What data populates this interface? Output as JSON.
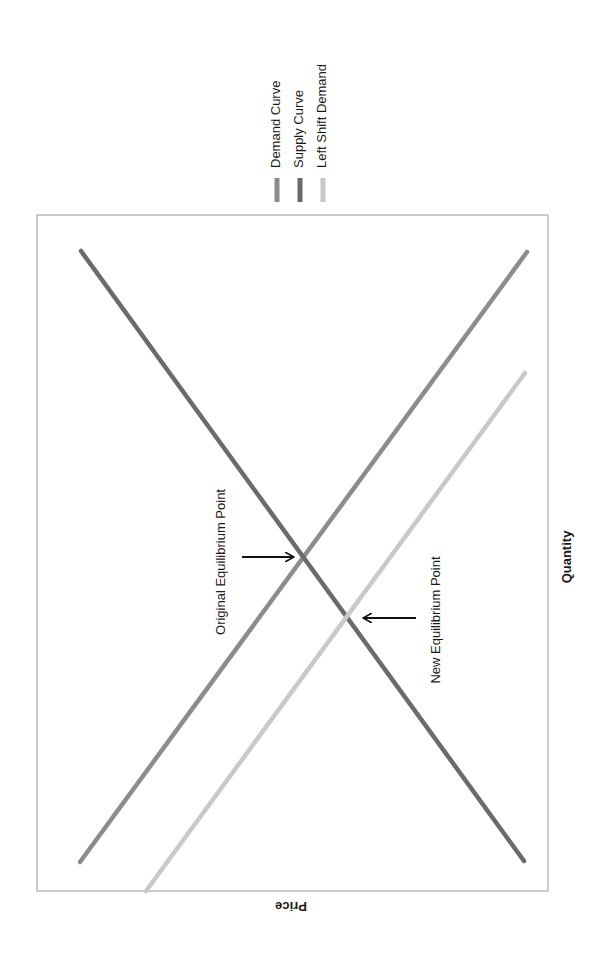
{
  "chart_data": {
    "type": "line",
    "orientation": "rotated 90 degrees clockwise (Quantity axis on right, Price axis label upside-down at bottom)",
    "title": "",
    "xlabel": "Quantity",
    "ylabel": "Price",
    "grid": false,
    "ticks": false,
    "legend_position": "top-center (rotated)",
    "series": [
      {
        "name": "Demand Curve",
        "color": "#8c8c8c",
        "description": "downward sloping",
        "points_px": [
          [
            80,
            862
          ],
          [
            527,
            252
          ]
        ]
      },
      {
        "name": "Supply Curve",
        "color": "#6b6b6b",
        "description": "upward sloping",
        "points_px": [
          [
            81,
            251
          ],
          [
            524,
            861
          ]
        ]
      },
      {
        "name": "Left Shift Demand",
        "color": "#c9c9c9",
        "description": "demand shifted left",
        "points_px": [
          [
            146,
            891
          ],
          [
            525,
            373
          ]
        ]
      }
    ],
    "annotations": [
      {
        "text": "Original Equilibrium Point",
        "point_px": [
          303,
          557
        ],
        "arrow_from_px": [
          242,
          557
        ],
        "arrow_to_px": [
          293,
          557
        ],
        "label_center_px": [
          222,
          562
        ]
      },
      {
        "text": "New Equilibrium Point",
        "point_px": [
          347,
          618
        ],
        "arrow_from_px": [
          416,
          618
        ],
        "arrow_to_px": [
          364,
          618
        ],
        "label_center_px": [
          437,
          620
        ]
      }
    ],
    "plot_box_px": {
      "left": 37,
      "top": 215,
      "right": 548,
      "bottom": 891
    }
  },
  "legend": {
    "items": [
      {
        "label": "Demand Curve",
        "color": "#8c8c8c",
        "x": 277
      },
      {
        "label": "Supply Curve",
        "color": "#6b6b6b",
        "x": 300
      },
      {
        "label": "Left Shift Demand",
        "color": "#c9c9c9",
        "x": 323
      }
    ]
  },
  "axes": {
    "x_label": "Quantity",
    "y_label": "Price"
  },
  "colors": {
    "frame": "#9a9a9a",
    "arrow": "#111111",
    "text": "#1a1a1a"
  }
}
